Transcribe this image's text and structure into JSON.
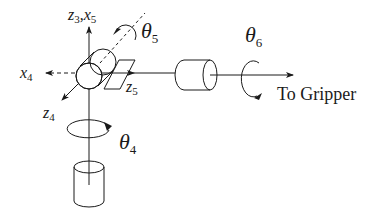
{
  "diagram": {
    "labels": {
      "z3_x5": "z",
      "z3_sub": "3",
      "comma": ",",
      "x5": "x",
      "x5_sub": "5",
      "x4": "x",
      "x4_sub": "4",
      "z5": "z",
      "z5_sub": "5",
      "z4": "z",
      "z4_sub": "4",
      "theta4": "θ",
      "theta4_sub": "4",
      "theta5": "θ",
      "theta5_sub": "5",
      "theta6": "θ",
      "theta6_sub": "6",
      "to_gripper": "To Gripper"
    },
    "colors": {
      "stroke": "#1a1a1a",
      "background": "#ffffff"
    }
  }
}
